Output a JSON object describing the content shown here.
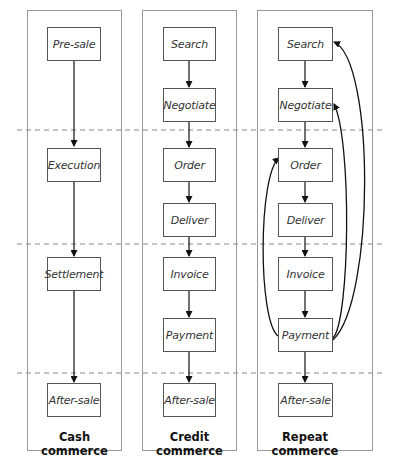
{
  "diagram": {
    "columns": [
      {
        "title": "Cash commerce",
        "steps": [
          "Pre-sale",
          "Execution",
          "Settlement",
          "After-sale"
        ]
      },
      {
        "title": "Credit commerce",
        "steps": [
          "Search",
          "Negotiate",
          "Order",
          "Deliver",
          "Invoice",
          "Payment",
          "After-sale"
        ]
      },
      {
        "title": "Repeat commerce",
        "steps": [
          "Search",
          "Negotiate",
          "Order",
          "Deliver",
          "Invoice",
          "Payment",
          "After-sale"
        ],
        "feedback_loops": [
          {
            "from": "Payment",
            "to": "Order"
          },
          {
            "from": "Payment",
            "to": "Negotiate"
          },
          {
            "from": "Payment",
            "to": "Search"
          }
        ]
      }
    ],
    "phase_separators": 3,
    "colors": {
      "panel_border": "#9a9a9a",
      "box_border": "#555555",
      "arrow": "#111111",
      "dashed_line": "#888888"
    }
  }
}
